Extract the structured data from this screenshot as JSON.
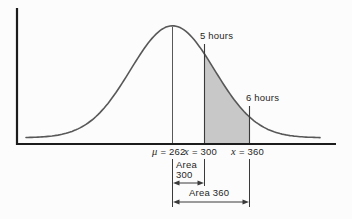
{
  "chart_data": {
    "type": "area",
    "curve": "normal-distribution",
    "title": "",
    "xlabel": "",
    "ylabel": "",
    "mean": 262,
    "x_axis_points": [
      {
        "value": 262,
        "label": "μ = 262"
      },
      {
        "value": 300,
        "label": "x = 300",
        "annotation": "5 hours"
      },
      {
        "value": 360,
        "label": "x = 360",
        "annotation": "6 hours"
      }
    ],
    "shaded_region": {
      "from_x": 300,
      "to_x": 360
    },
    "area_markers": [
      {
        "label": "Area 300",
        "from_x": 262,
        "to_x": 300
      },
      {
        "label": "Area 360",
        "from_x": 262,
        "to_x": 360
      }
    ],
    "grid": false,
    "legend": false
  },
  "labels": {
    "five_hours": "5 hours",
    "six_hours": "6 hours",
    "mu_symbol": "μ",
    "mu_value": "= 262",
    "x300_symbol": "x",
    "x300_value": "= 300",
    "x360_symbol": "x",
    "x360_value": "= 360",
    "area300_line1": "Area",
    "area300_line2": "300",
    "area360": "Area 360"
  },
  "colors": {
    "background": "#fcfcfc",
    "axis": "#1c1c1c",
    "curve": "#585858",
    "line": "#3a3a3a",
    "shade": "#c8c8c8",
    "text": "#1f1f1f"
  }
}
